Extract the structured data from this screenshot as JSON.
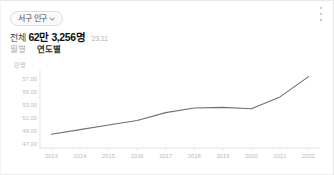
{
  "card": {
    "menu_icon": "kebab-menu-icon",
    "region_selector": {
      "label": "서구 인구",
      "chevron_icon": "chevron-down-icon"
    },
    "headline": {
      "prefix": "전체",
      "value": "62만 3,256명",
      "date": "’23.11"
    },
    "tabs": [
      {
        "label": "월별",
        "active": false
      },
      {
        "label": "연도별",
        "active": true
      }
    ]
  },
  "colors": {
    "line": "#6b6f7a",
    "axis": "#e3e3e3",
    "tick_text": "#b9b9b9",
    "headline_value": "#111111",
    "tab_active": "#333333",
    "tab_inactive": "#adadad",
    "pill_border": "#dcdcdc"
  },
  "chart_data": {
    "type": "line",
    "title": "",
    "xlabel": "",
    "ylabel": "만명",
    "unit_label": "만명",
    "legend": [],
    "legend_position": "none",
    "grid": false,
    "categories": [
      "2013",
      "2014",
      "2015",
      "2016",
      "2017",
      "2018",
      "2019",
      "2020",
      "2021",
      "2022"
    ],
    "x": [
      2013,
      2014,
      2015,
      2016,
      2017,
      2018,
      2019,
      2020,
      2021,
      2022
    ],
    "values": [
      48.5,
      49.2,
      49.9,
      50.6,
      51.8,
      52.5,
      52.6,
      52.4,
      54.2,
      57.3
    ],
    "ytick_labels": [
      "57.00",
      "55.00",
      "53.00",
      "51.00",
      "49.00",
      "47.00"
    ],
    "yticks": [
      57,
      55,
      53,
      51,
      49,
      47
    ],
    "ylim": [
      46.4,
      58.0
    ],
    "xlim": [
      2012.6,
      2022.4
    ]
  }
}
